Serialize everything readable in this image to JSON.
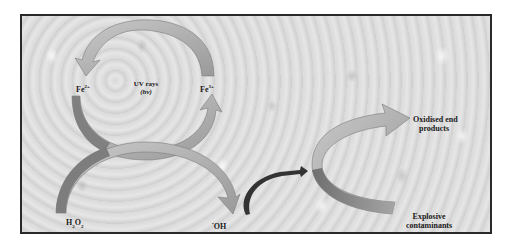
{
  "diagram": {
    "background": "water-droplet texture",
    "frame_border_color": "#2a2a2a",
    "arrow_colors": {
      "light": "#b8b8b8",
      "dark": "#7a7a7a",
      "curl": "#333333"
    },
    "nodes": {
      "fe2": {
        "base": "Fe",
        "sup": "2+"
      },
      "fe3": {
        "base": "Fe",
        "sup": "3+"
      },
      "uv": {
        "line1": "UV rays",
        "line2": "(hv)"
      },
      "h2o2": {
        "p1": "H",
        "s1": "2",
        "p2": "O",
        "s2": "2"
      },
      "oh": {
        "dot": "•",
        "base": "OH"
      },
      "oxidised": {
        "line1": "Oxidised end",
        "line2": "products"
      },
      "explosive": {
        "line1": "Explosive",
        "line2": "contaminants"
      }
    },
    "edges": [
      {
        "from": "Fe3+",
        "to": "Fe2+",
        "label": "reduction (top arc)"
      },
      {
        "from": "Fe2+",
        "to": "Fe3+",
        "label": "oxidation (lower arc)"
      },
      {
        "from": "H2O2",
        "to": "•OH"
      },
      {
        "from": "•OH",
        "to": "Explosive contaminants"
      },
      {
        "from": "Explosive contaminants",
        "to": "Oxidised end products"
      }
    ]
  }
}
